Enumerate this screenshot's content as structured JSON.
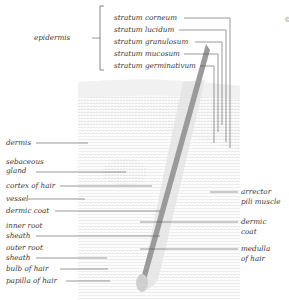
{
  "diagram": {
    "title": "",
    "bracket_group": {
      "label": "epidermis",
      "members": [
        "stratum corneum",
        "stratum lucidum",
        "stratum granulosum",
        "stratum mucosum",
        "stratum germinativum"
      ]
    },
    "left_labels": [
      {
        "text": "dermis"
      },
      {
        "text": "sebaceous gland",
        "lines": [
          "sebaceous",
          "gland"
        ]
      },
      {
        "text": "cortex of hair"
      },
      {
        "text": "vessel"
      },
      {
        "text": "dermic coat"
      },
      {
        "text": "inner root sheath",
        "lines": [
          "inner root",
          "sheath"
        ]
      },
      {
        "text": "outer root sheath",
        "lines": [
          "outer root",
          "sheath"
        ]
      },
      {
        "text": "bulb of hair"
      },
      {
        "text": "papilla of hair"
      }
    ],
    "right_labels": [
      {
        "text": "arrector pili muscle",
        "lines": [
          "arrector",
          "pili muscle"
        ]
      },
      {
        "text": "dermic coat",
        "lines": [
          "dermic",
          "coat"
        ]
      },
      {
        "text": "medulla of hair",
        "lines": [
          "medulla",
          "of hair"
        ]
      }
    ],
    "corner_mark": "©"
  }
}
